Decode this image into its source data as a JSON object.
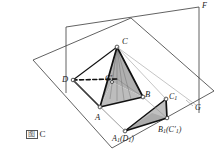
{
  "figure": {
    "caption": "图 C",
    "caption_mark": "图",
    "caption_letter": "C"
  },
  "colors": {
    "line": "#1a1a1a",
    "thin_line": "#555555",
    "fill_shaded": "#b8b8b8",
    "fill_shaded_light": "#c9c9c9",
    "background": "#ffffff"
  },
  "labels": [
    {
      "id": "label-F",
      "text": "F",
      "x": 203,
      "y": 3,
      "size": "sm"
    },
    {
      "id": "label-C",
      "text": "C",
      "x": 122,
      "y": 38,
      "size": "md"
    },
    {
      "id": "label-D",
      "text": "D",
      "x": 63,
      "y": 76,
      "size": "md"
    },
    {
      "id": "label-Cp",
      "text": "C",
      "sup": "′",
      "x": 106,
      "y": 75,
      "size": "sm"
    },
    {
      "id": "label-B",
      "text": "B",
      "x": 146,
      "y": 92,
      "size": "md"
    },
    {
      "id": "label-C1",
      "text": "C",
      "sub": "1",
      "x": 169,
      "y": 95,
      "size": "sm"
    },
    {
      "id": "label-A",
      "text": "A",
      "x": 96,
      "y": 114,
      "size": "md"
    },
    {
      "id": "label-G",
      "text": "G",
      "x": 196,
      "y": 106,
      "size": "sm"
    },
    {
      "id": "label-B1C1",
      "text": "B",
      "sub": "1",
      "paren": "(C′1)",
      "x": 160,
      "y": 127,
      "size": "sm"
    },
    {
      "id": "label-A1D1",
      "text": "A",
      "sub": "1",
      "paren": "(D1)",
      "x": 113,
      "y": 136,
      "size": "sm"
    }
  ],
  "vertices": {
    "C": {
      "x": 117,
      "y": 47
    },
    "D": {
      "x": 73,
      "y": 80
    },
    "A": {
      "x": 100,
      "y": 107
    },
    "B": {
      "x": 143,
      "y": 97
    },
    "Cprime": {
      "x": 112,
      "y": 82
    },
    "A1": {
      "x": 125,
      "y": 131
    },
    "B1": {
      "x": 167,
      "y": 118
    },
    "C1": {
      "x": 166,
      "y": 99
    }
  },
  "planes": {
    "horizontal": {
      "name": "base-plane",
      "points": "33,60 131,18 214,91 112,148"
    },
    "vertical": {
      "name": "back-plane",
      "points": "65,93 65,28 199,8 199,113"
    }
  }
}
